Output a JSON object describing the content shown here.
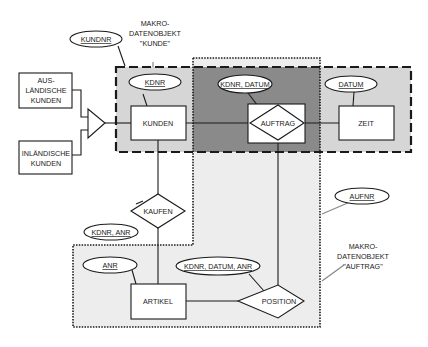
{
  "diagram": {
    "type": "entity-relationship",
    "macro_objects": [
      {
        "id": "kunde",
        "label_lines": [
          "MAKRO-",
          "DATENOBJEKT",
          "\"KUNDE\""
        ],
        "border": "dashed"
      },
      {
        "id": "auftrag",
        "label_lines": [
          "MAKRO-",
          "DATENOBJEKT",
          "\"AUFTRAG\""
        ],
        "border": "dotted"
      }
    ],
    "entities": {
      "auslaendische_kunden": [
        "AUS-",
        "LÄNDISCHE",
        "KUNDEN"
      ],
      "inlaendische_kunden": [
        "INLÄNDISCHE",
        "KUNDEN"
      ],
      "kunden": "KUNDEN",
      "zeit": "ZEIT",
      "artikel": "ARTIKEL"
    },
    "relationships": {
      "auftrag": "AUFTRAG",
      "kaufen": "KAUFEN",
      "position": "POSITION"
    },
    "attributes": {
      "kundnr": "KUNDNR",
      "kdnr": "KDNR",
      "kdnr_datum": "KDNR, DATUM",
      "datum": "DATUM",
      "aufnr": "AUFNR",
      "kdnr_anr": "KDNR, ANR",
      "anr": "ANR",
      "kdnr_datum_anr": "KDNR, DATUM, ANR"
    },
    "colors": {
      "light_fill": "#d9d9d9",
      "dark_fill": "#8c8c8c",
      "dotted_fill": "#ececec",
      "line": "#1a1a1a"
    }
  }
}
